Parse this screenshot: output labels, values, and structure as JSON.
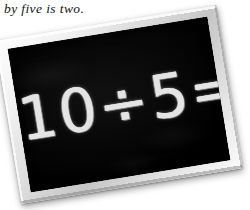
{
  "caption": {
    "text": "by five is two."
  },
  "chalkboard": {
    "name": "chalkboard",
    "equation": "10÷5=2",
    "equation_parts": {
      "dividend": "10",
      "operator": "÷",
      "divisor": "5",
      "equals": "=",
      "quotient": "2"
    },
    "frame_color": "#d9d9d9",
    "slate_color": "#040404",
    "chalk_color": "#ececec",
    "rotation_degrees": -9.2
  },
  "page": {
    "background_color": "#ffffff"
  }
}
